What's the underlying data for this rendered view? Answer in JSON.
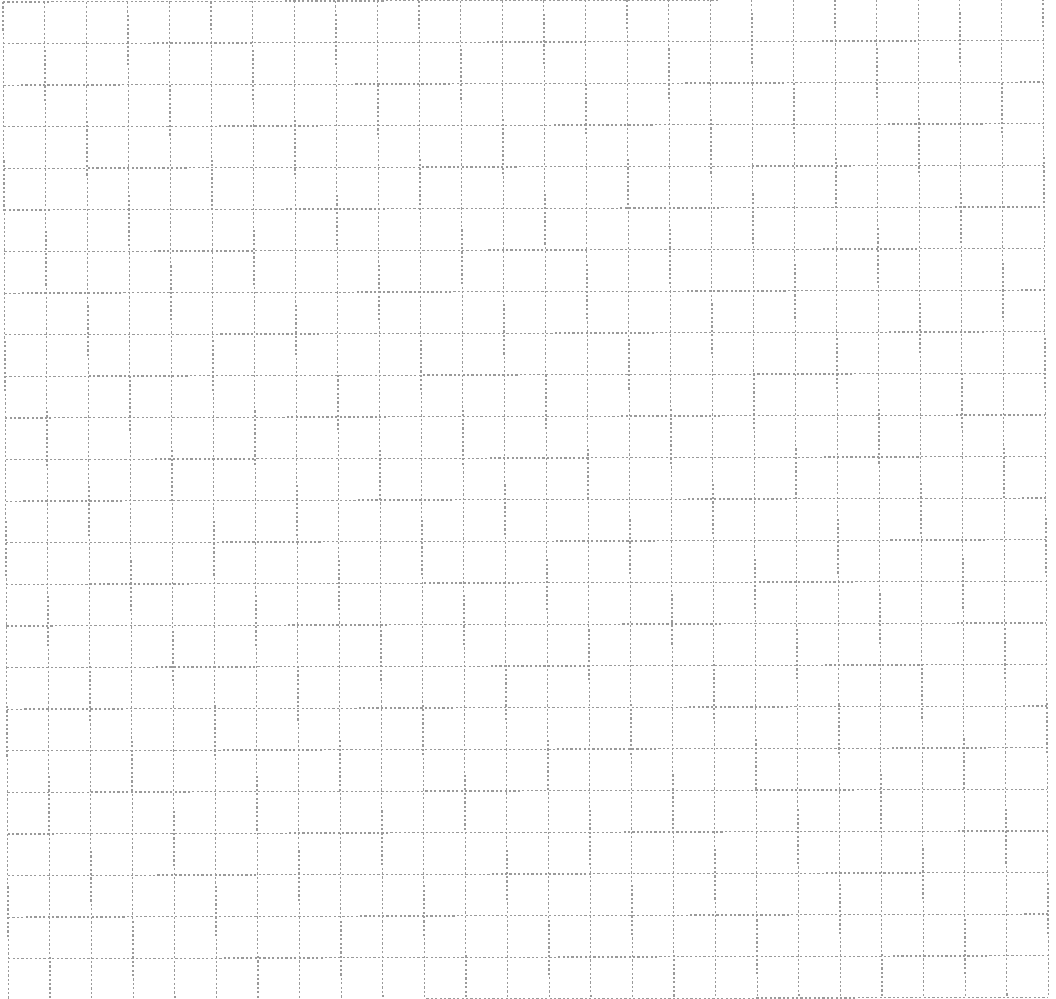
{
  "sheet": {
    "type": "dashed-graph-paper",
    "background_color": "#ffffff",
    "line_color": "#9a9a9a"
  },
  "grid": {
    "columns": 25,
    "rows": 24,
    "cell_size_px": 41.6,
    "origin": {
      "x": 3,
      "y": 2
    },
    "skew": {
      "dx_per_y": 0.0055,
      "dy_per_x": -0.003
    },
    "line_style": "dashed",
    "dash_px": 2.2,
    "gap_px": 2.2
  }
}
